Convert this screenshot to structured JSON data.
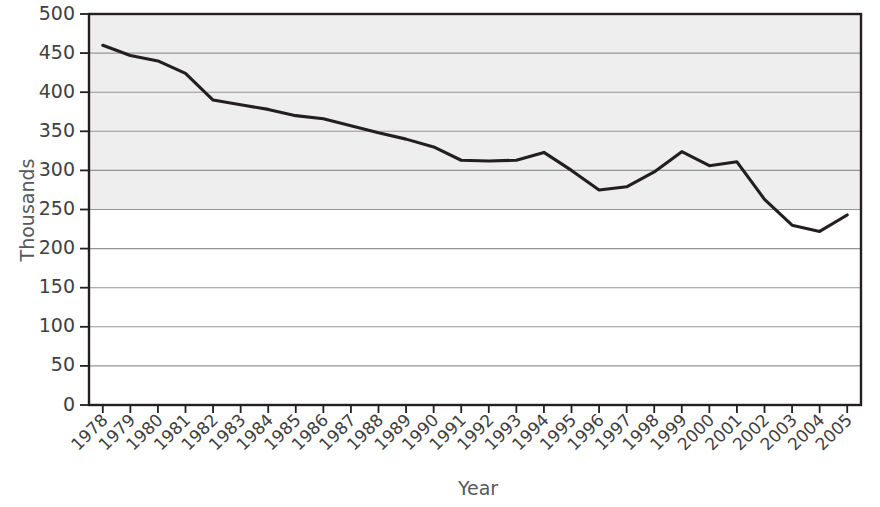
{
  "chart_data": {
    "type": "line",
    "title": "",
    "xlabel": "Year",
    "ylabel": "Thousands",
    "x": [
      1978,
      1979,
      1980,
      1981,
      1982,
      1983,
      1984,
      1985,
      1986,
      1987,
      1988,
      1989,
      1990,
      1991,
      1992,
      1993,
      1994,
      1995,
      1996,
      1997,
      1998,
      1999,
      2000,
      2001,
      2002,
      2003,
      2004,
      2005
    ],
    "categories": [
      "1978",
      "1979",
      "1980",
      "1981",
      "1982",
      "1983",
      "1984",
      "1985",
      "1986",
      "1987",
      "1988",
      "1989",
      "1990",
      "1991",
      "1992",
      "1993",
      "1994",
      "1995",
      "1996",
      "1997",
      "1998",
      "1999",
      "2000",
      "2001",
      "2002",
      "2003",
      "2004",
      "2005"
    ],
    "values": [
      460,
      447,
      440,
      424,
      390,
      384,
      378,
      370,
      366,
      357,
      348,
      340,
      330,
      313,
      312,
      313,
      323,
      300,
      275,
      279,
      298,
      324,
      306,
      311,
      263,
      230,
      222,
      243
    ],
    "series": [
      {
        "name": "Thousands",
        "values": [
          460,
          447,
          440,
          424,
          390,
          384,
          378,
          370,
          366,
          357,
          348,
          340,
          330,
          313,
          312,
          313,
          323,
          300,
          275,
          279,
          298,
          324,
          306,
          311,
          263,
          230,
          222,
          243
        ]
      }
    ],
    "ylim": [
      0,
      500
    ],
    "ytick_step": 50,
    "yticks": [
      0,
      50,
      100,
      150,
      200,
      250,
      300,
      350,
      400,
      450,
      500
    ],
    "ytick_labels": [
      "0",
      "50",
      "100",
      "150",
      "200",
      "250",
      "300",
      "350",
      "400",
      "450",
      "500"
    ],
    "grid": true,
    "legend": false,
    "legend_position": "none",
    "line_color": "#231f20",
    "grid_color": "#939598",
    "axis_color": "#231f20",
    "plot_background_upper": "#eeeeee",
    "plot_background_lower": "#ffffff",
    "shading_boundary_value": 250,
    "xtick_label_rotation_deg": -45
  }
}
